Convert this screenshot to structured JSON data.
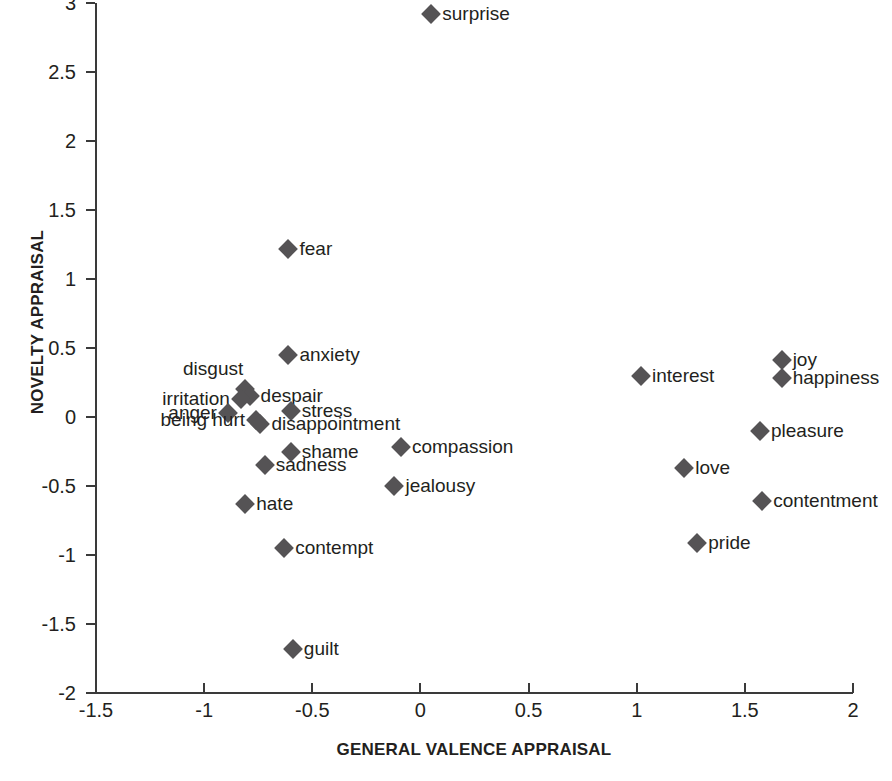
{
  "chart_data": {
    "type": "scatter",
    "title": "",
    "xlabel": "GENERAL VALENCE APPRAISAL",
    "ylabel": "NOVELTY APPRAISAL",
    "xlim": [
      -1.5,
      2
    ],
    "ylim": [
      -2,
      3
    ],
    "xticks": [
      "-1.5",
      "-1",
      "-0.5",
      "0",
      "0.5",
      "1",
      "1.5",
      "2"
    ],
    "xtick_values": [
      -1.5,
      -1,
      -0.5,
      0,
      0.5,
      1,
      1.5,
      2
    ],
    "yticks": [
      "3",
      "2.5",
      "2",
      "1.5",
      "1",
      "0.5",
      "0",
      "-0.5",
      "-1",
      "-1.5",
      "-2"
    ],
    "ytick_values": [
      3,
      2.5,
      2,
      1.5,
      1,
      0.5,
      0,
      -0.5,
      -1,
      -1.5,
      -2
    ],
    "grid": false,
    "legend": "none",
    "marker": "diamond",
    "marker_color": "#555355",
    "points": [
      {
        "label": "surprise",
        "x": 0.05,
        "y": 2.92,
        "side": "right"
      },
      {
        "label": "fear",
        "x": -0.61,
        "y": 1.22,
        "side": "right"
      },
      {
        "label": "anxiety",
        "x": -0.61,
        "y": 0.45,
        "side": "right"
      },
      {
        "label": "joy",
        "x": 1.67,
        "y": 0.41,
        "side": "right"
      },
      {
        "label": "happiness",
        "x": 1.67,
        "y": 0.28,
        "side": "right"
      },
      {
        "label": "interest",
        "x": 1.02,
        "y": 0.3,
        "side": "right"
      },
      {
        "label": "disgust",
        "x": -0.81,
        "y": 0.2,
        "side": "above-left"
      },
      {
        "label": "despair",
        "x": -0.79,
        "y": 0.15,
        "side": "right"
      },
      {
        "label": "irritation",
        "x": -0.83,
        "y": 0.13,
        "side": "left"
      },
      {
        "label": "stress",
        "x": -0.6,
        "y": 0.04,
        "side": "right"
      },
      {
        "label": "anger",
        "x": -0.89,
        "y": 0.03,
        "side": "left"
      },
      {
        "label": "being hurt",
        "x": -0.76,
        "y": -0.02,
        "side": "left"
      },
      {
        "label": "disappointment",
        "x": -0.74,
        "y": -0.05,
        "side": "right"
      },
      {
        "label": "pleasure",
        "x": 1.57,
        "y": -0.1,
        "side": "right"
      },
      {
        "label": "compassion",
        "x": -0.09,
        "y": -0.22,
        "side": "right"
      },
      {
        "label": "shame",
        "x": -0.6,
        "y": -0.25,
        "side": "right"
      },
      {
        "label": "sadness",
        "x": -0.72,
        "y": -0.35,
        "side": "right"
      },
      {
        "label": "love",
        "x": 1.22,
        "y": -0.37,
        "side": "right"
      },
      {
        "label": "jealousy",
        "x": -0.12,
        "y": -0.5,
        "side": "right"
      },
      {
        "label": "contentment",
        "x": 1.58,
        "y": -0.61,
        "side": "right"
      },
      {
        "label": "hate",
        "x": -0.81,
        "y": -0.63,
        "side": "right"
      },
      {
        "label": "pride",
        "x": 1.28,
        "y": -0.91,
        "side": "right"
      },
      {
        "label": "contempt",
        "x": -0.63,
        "y": -0.95,
        "side": "right"
      },
      {
        "label": "guilt",
        "x": -0.59,
        "y": -1.68,
        "side": "right"
      }
    ]
  }
}
